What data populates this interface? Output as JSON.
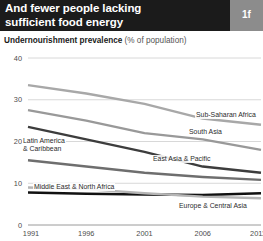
{
  "header": {
    "title_lines": [
      "And fewer people lacking",
      "sufficient food energy"
    ],
    "badge": "1f",
    "background_color": "#1b1b1b",
    "badge_color": "#8c8c8c"
  },
  "subtitle": {
    "bold_part": "Undernourishment prevalence",
    "rest": " (% of population)"
  },
  "chart_data": {
    "type": "line",
    "title": "Undernourishment prevalence (% of population)",
    "xlabel": "",
    "ylabel": "",
    "x": [
      1991,
      1996,
      2001,
      2006,
      2011
    ],
    "xtick_labels": [
      "1991",
      "1996",
      "2001",
      "2006",
      "2011"
    ],
    "ytick_labels": [
      "0",
      "10",
      "20",
      "30",
      "40"
    ],
    "yticks": [
      0,
      10,
      20,
      30,
      40
    ],
    "ylim": [
      0,
      40
    ],
    "xlim": [
      1991,
      2011
    ],
    "grid": "horizontal",
    "legend": "inline-labels",
    "series": [
      {
        "name": "Sub-Saharan Africa",
        "values": [
          33.5,
          31.5,
          29.0,
          25.5,
          24.0
        ],
        "color": "#a8a8a8",
        "width": 2.4,
        "label_x": 195,
        "label_y": 111
      },
      {
        "name": "South Asia",
        "values": [
          27.5,
          25.0,
          22.0,
          20.5,
          18.0
        ],
        "color": "#999999",
        "width": 2.4,
        "label_x": 188,
        "label_y": 128
      },
      {
        "name": "East Asia & Pacific",
        "values": [
          23.5,
          20.5,
          17.5,
          14.0,
          12.5
        ],
        "color": "#3d3d3d",
        "width": 2.4,
        "label_x": 152,
        "label_y": 155
      },
      {
        "name": "Latin America & Caribbean",
        "values": [
          15.5,
          14.0,
          12.5,
          11.5,
          10.8
        ],
        "color": "#6e6e6e",
        "width": 2.4,
        "label_lines": [
          "Latin America",
          "& Caribbean"
        ],
        "label_x": 22,
        "label_y": 137
      },
      {
        "name": "Middle East & North Africa",
        "values": [
          7.8,
          7.5,
          7.3,
          7.2,
          7.6
        ],
        "color": "#111111",
        "width": 2.6,
        "label_x": 33,
        "label_y": 183
      },
      {
        "name": "Europe & Central Asia",
        "values": [
          9.0,
          8.6,
          7.6,
          6.8,
          6.4
        ],
        "color": "#b5b5b5",
        "width": 2.4,
        "label_x": 178,
        "label_y": 202
      }
    ]
  }
}
